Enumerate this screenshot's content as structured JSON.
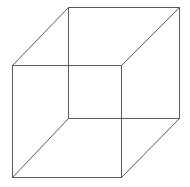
{
  "diagram": {
    "type": "wireframe-cube",
    "stroke_color": "#5a5a5a",
    "background_color": "#ffffff",
    "vertices": {
      "front_top_left": "A",
      "front_top_right": "B",
      "front_bottom_right": "C",
      "front_bottom_left": "D",
      "back_top_left": "E",
      "back_top_right": "F",
      "back_bottom_right": "G",
      "back_bottom_left": "H"
    },
    "edges": [
      {
        "name": "front-top-edge",
        "from": "A",
        "to": "B"
      },
      {
        "name": "front-right-edge",
        "from": "B",
        "to": "C"
      },
      {
        "name": "front-bottom-edge",
        "from": "C",
        "to": "D"
      },
      {
        "name": "front-left-edge",
        "from": "D",
        "to": "A"
      },
      {
        "name": "back-top-edge",
        "from": "E",
        "to": "F"
      },
      {
        "name": "back-right-edge",
        "from": "F",
        "to": "G"
      },
      {
        "name": "back-bottom-edge",
        "from": "G",
        "to": "H"
      },
      {
        "name": "back-left-edge",
        "from": "H",
        "to": "E"
      },
      {
        "name": "depth-edge-top-left",
        "from": "A",
        "to": "E"
      },
      {
        "name": "depth-edge-top-right",
        "from": "B",
        "to": "F"
      },
      {
        "name": "depth-edge-bottom-right",
        "from": "C",
        "to": "G"
      },
      {
        "name": "depth-edge-bottom-left",
        "from": "D",
        "to": "H"
      }
    ]
  }
}
